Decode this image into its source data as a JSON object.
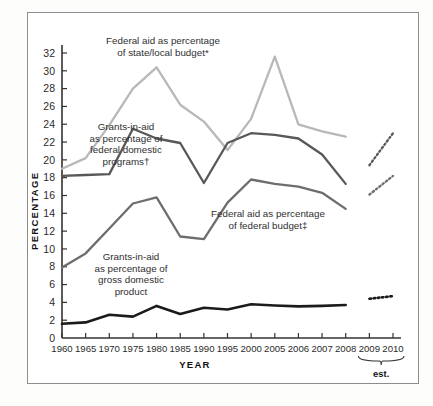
{
  "chart_data": {
    "type": "line",
    "title": "",
    "xlabel": "YEAR",
    "ylabel": "PERCENTAGE",
    "ylim": [
      0,
      33
    ],
    "yticks": [
      0,
      2,
      4,
      6,
      8,
      10,
      12,
      14,
      16,
      18,
      20,
      22,
      24,
      26,
      28,
      30,
      32
    ],
    "categories": [
      "1960",
      "1965",
      "1970",
      "1975",
      "1980",
      "1985",
      "1990",
      "1995",
      "2000",
      "2005",
      "2006",
      "2007",
      "2008",
      "2009",
      "2010"
    ],
    "grid": false,
    "legend_position": "inline-annotations",
    "estimate_note": "est.",
    "estimate_years": [
      "2009",
      "2010"
    ],
    "series": [
      {
        "name": "Federal aid as percentage of state/local budget*",
        "color": "#b8b8b8",
        "label_lines": [
          "Federal aid as percentage",
          "of state/local budget*"
        ],
        "values": [
          19.0,
          20.2,
          23.9,
          28.0,
          30.4,
          26.2,
          24.3,
          21.1,
          24.6,
          31.6,
          24.0,
          23.2,
          22.6,
          null,
          null
        ],
        "estimate_values": [
          null,
          null
        ]
      },
      {
        "name": "Grants-in-aid as percentage of federal domestic programs†",
        "color": "#585858",
        "label_lines": [
          "Grants-in-aid",
          "as percentage of",
          "federal domestic",
          "programs†"
        ],
        "values": [
          18.2,
          18.3,
          18.4,
          23.5,
          22.4,
          21.9,
          17.4,
          21.9,
          23.0,
          22.8,
          22.4,
          20.6,
          17.3,
          null,
          null
        ],
        "estimate_values": [
          19.4,
          23.0
        ]
      },
      {
        "name": "Federal aid as percentage of federal budget‡",
        "color": "#6d6d6d",
        "label_lines": [
          "Federal aid as percentage",
          "of federal budget‡"
        ],
        "values": [
          7.9,
          9.5,
          12.3,
          15.1,
          15.8,
          11.4,
          11.1,
          15.2,
          17.8,
          17.3,
          17.0,
          16.3,
          14.5,
          null,
          null
        ],
        "estimate_values": [
          16.1,
          18.2
        ]
      },
      {
        "name": "Grants-in-aid as percentage of gross domestic product",
        "color": "#1b1b1b",
        "label_lines": [
          "Grants-in-aid",
          "as percentage of",
          "gross domestic",
          "product"
        ],
        "values": [
          1.6,
          1.75,
          2.6,
          2.4,
          3.6,
          2.7,
          3.4,
          3.2,
          3.8,
          3.65,
          3.55,
          3.6,
          3.7,
          null,
          null
        ],
        "estimate_values": [
          4.4,
          4.7
        ]
      }
    ],
    "footnote_markers": [
      "*",
      "†",
      "‡"
    ]
  },
  "annotations": {
    "state_local": {
      "line1": "Federal aid as percentage",
      "line2": "of state/local budget*"
    },
    "domestic": {
      "line1": "Grants-in-aid",
      "line2": "as percentage of",
      "line3": "federal domestic",
      "line4": "programs†"
    },
    "fed_budget": {
      "line1": "Federal aid as percentage",
      "line2": "of federal budget‡"
    },
    "gdp": {
      "line1": "Grants-in-aid",
      "line2": "as percentage of",
      "line3": "gross domestic",
      "line4": "product"
    }
  },
  "axes": {
    "y_title": "PERCENTAGE",
    "x_title": "YEAR",
    "y_ticks": [
      "0",
      "2",
      "4",
      "6",
      "8",
      "10",
      "12",
      "14",
      "16",
      "18",
      "20",
      "22",
      "24",
      "26",
      "28",
      "30",
      "32"
    ],
    "x_ticks": [
      "1960",
      "1965",
      "1970",
      "1975",
      "1980",
      "1985",
      "1990",
      "1995",
      "2000",
      "2005",
      "2006",
      "2007",
      "2008",
      "2009",
      "2010"
    ]
  },
  "est_bracket": {
    "label": "est."
  }
}
